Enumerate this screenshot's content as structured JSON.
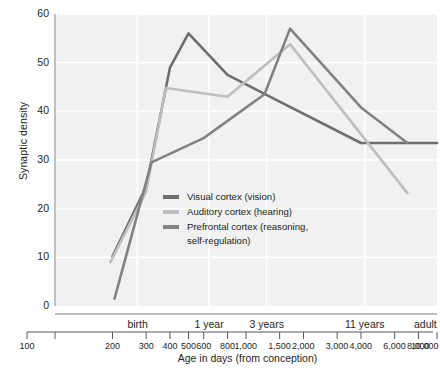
{
  "chart_data": {
    "type": "line",
    "title": "",
    "xlabel": "Age in days (from conception)",
    "ylabel": "Synaptic density",
    "xscale": "log",
    "xlim": [
      100,
      10000
    ],
    "ylim": [
      0,
      60
    ],
    "yticks": [
      0,
      10,
      20,
      30,
      40,
      50,
      60
    ],
    "xticks": [
      100,
      200,
      300,
      400,
      500,
      600,
      800,
      1000,
      1500,
      2000,
      3000,
      4000,
      6000,
      8000,
      10000
    ],
    "xtick_labels": [
      "100",
      "200",
      "300",
      "400",
      "500",
      "600",
      "800",
      "1,000",
      "1,500",
      "2,000",
      "3,000",
      "4,000",
      "6,000",
      "8,000",
      "10,000"
    ],
    "period_ticks": [
      {
        "label": "birth",
        "x": 270
      },
      {
        "label": "1 year",
        "x": 640
      },
      {
        "label": "3 years",
        "x": 1280
      },
      {
        "label": "11 years",
        "x": 4200
      },
      {
        "label": "adult",
        "x": 10000
      }
    ],
    "grid": true,
    "grid_x": [
      270,
      640,
      1280,
      4200
    ],
    "legend_position": "center",
    "series": [
      {
        "name": "Visual cortex (vision)",
        "color": "#6d6e71",
        "points": [
          {
            "x": 200,
            "y": 10.2
          },
          {
            "x": 300,
            "y": 24.5
          },
          {
            "x": 400,
            "y": 49.0
          },
          {
            "x": 500,
            "y": 56.0
          },
          {
            "x": 800,
            "y": 47.5
          },
          {
            "x": 1500,
            "y": 42.0
          },
          {
            "x": 4000,
            "y": 33.5
          },
          {
            "x": 10000,
            "y": 33.5
          }
        ]
      },
      {
        "name": "Auditory cortex (hearing)",
        "color": "#bcbec0",
        "points": [
          {
            "x": 195,
            "y": 9.0
          },
          {
            "x": 300,
            "y": 23.5
          },
          {
            "x": 380,
            "y": 44.8
          },
          {
            "x": 800,
            "y": 43.0
          },
          {
            "x": 1700,
            "y": 53.8
          },
          {
            "x": 7000,
            "y": 23.2
          }
        ]
      },
      {
        "name": "Prefrontal cortex (reasoning,\nself-regulation)",
        "color": "#808285",
        "points": [
          {
            "x": 205,
            "y": 1.5
          },
          {
            "x": 320,
            "y": 29.5
          },
          {
            "x": 600,
            "y": 34.5
          },
          {
            "x": 1250,
            "y": 43.5
          },
          {
            "x": 1700,
            "y": 57.0
          },
          {
            "x": 4000,
            "y": 40.8
          },
          {
            "x": 7000,
            "y": 33.5
          }
        ]
      }
    ]
  },
  "legend": {
    "items": [
      {
        "label": "Visual cortex (vision)",
        "color": "#6d6e71"
      },
      {
        "label": "Auditory cortex (hearing)",
        "color": "#bcbec0"
      },
      {
        "label": "Prefrontal cortex (reasoning,\nself-regulation)",
        "color": "#808285"
      }
    ]
  }
}
